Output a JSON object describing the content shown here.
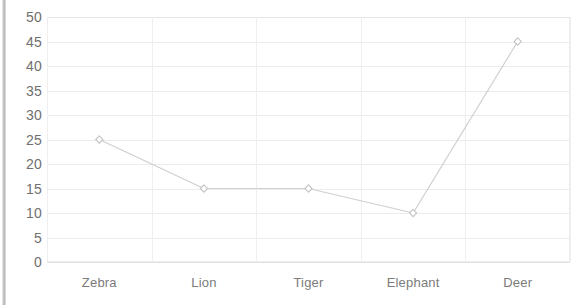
{
  "chart_data": {
    "type": "line",
    "title": "",
    "subtitle": "",
    "xlabel": "",
    "ylabel": "",
    "categories": [
      "Zebra",
      "Lion",
      "Tiger",
      "Elephant",
      "Deer"
    ],
    "values": [
      25,
      15,
      15,
      10,
      45
    ],
    "series": [
      {
        "name": "",
        "values": [
          25,
          15,
          15,
          10,
          45
        ]
      }
    ],
    "ylim": [
      0,
      50
    ],
    "ytick_step": 5,
    "ytick_labels": [
      "50",
      "45",
      "40",
      "35",
      "30",
      "25",
      "20",
      "15",
      "10",
      "5",
      "0"
    ],
    "ytick_values": [
      50,
      45,
      40,
      35,
      30,
      25,
      20,
      15,
      10,
      5,
      0
    ],
    "grid": {
      "horizontal": true,
      "vertical": true
    },
    "legend": {
      "visible": false,
      "position": "none",
      "entries": []
    },
    "marker": "diamond",
    "annotations": [],
    "colors": {
      "line": "#cfcfcf",
      "marker_stroke": "#c4c4c4",
      "marker_fill": "#ffffff",
      "gridline": "#ececec",
      "axis_border": "#ededed",
      "ytick_text": "#6f6f6f",
      "xtick_text": "#7b7b7b",
      "background": "#ffffff",
      "page_edge": "#a9a9a9"
    }
  }
}
